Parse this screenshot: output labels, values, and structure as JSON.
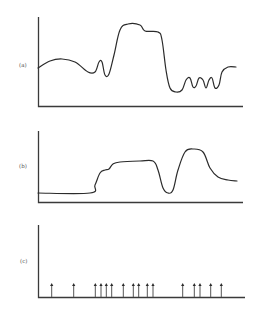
{
  "figure": {
    "panels": [
      {
        "id": "a",
        "label": "(a)"
      },
      {
        "id": "b",
        "label": "(b)"
      },
      {
        "id": "c",
        "label": "(c)"
      }
    ]
  },
  "chart_data": [
    {
      "type": "line",
      "panel": "(a)",
      "title": "",
      "xlabel": "",
      "ylabel": "",
      "grid": false,
      "description": "Continuous signal: broad hump, small narrow peak, tall plateau with step, deep trough, three small oscillations, then recovery",
      "points_px": [
        [
          38,
          68
        ],
        [
          50,
          61
        ],
        [
          62,
          59
        ],
        [
          75,
          62
        ],
        [
          88,
          72
        ],
        [
          95,
          72
        ],
        [
          99,
          62
        ],
        [
          102,
          62
        ],
        [
          105,
          75
        ],
        [
          109,
          74
        ],
        [
          114,
          55
        ],
        [
          120,
          30
        ],
        [
          128,
          24
        ],
        [
          140,
          25
        ],
        [
          145,
          31
        ],
        [
          158,
          32
        ],
        [
          162,
          40
        ],
        [
          166,
          70
        ],
        [
          170,
          88
        ],
        [
          176,
          92
        ],
        [
          182,
          90
        ],
        [
          186,
          80
        ],
        [
          190,
          78
        ],
        [
          193,
          87
        ],
        [
          196,
          86
        ],
        [
          199,
          78
        ],
        [
          203,
          80
        ],
        [
          206,
          88
        ],
        [
          209,
          80
        ],
        [
          212,
          78
        ],
        [
          215,
          88
        ],
        [
          219,
          85
        ],
        [
          222,
          72
        ],
        [
          228,
          67
        ],
        [
          236,
          67
        ]
      ]
    },
    {
      "type": "line",
      "panel": "(b)",
      "title": "",
      "xlabel": "",
      "ylabel": "",
      "grid": false,
      "description": "Step-like signal: low baseline, rising shoulder to plateau, sharp dip, rounded peak, decay to intermediate level",
      "points_px": [
        [
          38,
          193
        ],
        [
          90,
          193
        ],
        [
          95,
          185
        ],
        [
          100,
          173
        ],
        [
          105,
          170
        ],
        [
          109,
          169
        ],
        [
          113,
          164
        ],
        [
          120,
          162
        ],
        [
          140,
          161
        ],
        [
          153,
          161
        ],
        [
          158,
          170
        ],
        [
          163,
          188
        ],
        [
          168,
          193
        ],
        [
          173,
          190
        ],
        [
          178,
          170
        ],
        [
          185,
          152
        ],
        [
          193,
          149
        ],
        [
          203,
          152
        ],
        [
          210,
          168
        ],
        [
          218,
          177
        ],
        [
          228,
          180
        ],
        [
          237,
          181
        ]
      ]
    },
    {
      "type": "scatter",
      "panel": "(c)",
      "title": "",
      "xlabel": "",
      "ylabel": "",
      "grid": false,
      "description": "Spike train: 16 upward event arrows of equal height along the baseline",
      "arrow_count": 16,
      "arrow_x_px": [
        51.7,
        73.7,
        95.3,
        101,
        106.3,
        111.7,
        123.3,
        133.3,
        138.7,
        147.3,
        153,
        182.7,
        194.3,
        200,
        210.7,
        221.3
      ],
      "baseline_y_px": 297,
      "arrow_tip_y_px": 283
    }
  ]
}
